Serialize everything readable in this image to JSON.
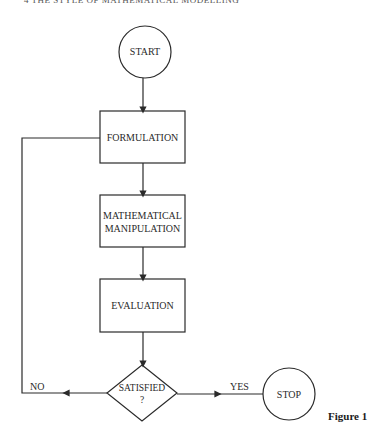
{
  "header": {
    "running_title": "4    THE STYLE OF MATHEMATICAL MODELLING"
  },
  "flowchart": {
    "start": {
      "label": "START",
      "shape": "circle"
    },
    "steps": [
      {
        "label": "FORMULATION",
        "shape": "rectangle"
      },
      {
        "label_line1": "MATHEMATICAL",
        "label_line2": "MANIPULATION",
        "shape": "rectangle"
      },
      {
        "label": "EVALUATION",
        "shape": "rectangle"
      }
    ],
    "decision": {
      "label_line1": "SATISFIED",
      "label_line2": "?",
      "shape": "diamond"
    },
    "branches": {
      "no": "NO",
      "yes": "YES"
    },
    "stop": {
      "label": "STOP",
      "shape": "circle"
    }
  },
  "caption": "Figure 1"
}
